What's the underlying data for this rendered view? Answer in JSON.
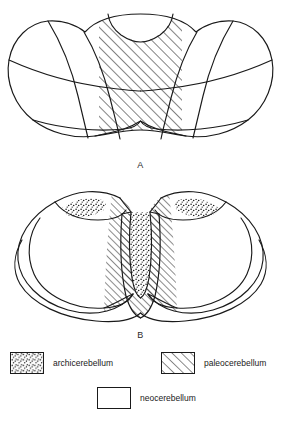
{
  "figure": {
    "panels": [
      {
        "id": "A",
        "label": "A",
        "view": "superior-view-cerebellum"
      },
      {
        "id": "B",
        "label": "B",
        "view": "inferior-view-cerebellum"
      }
    ]
  },
  "legend": {
    "items": [
      {
        "key": "archicerebellum",
        "label": "archicerebellum",
        "pattern": "stipple"
      },
      {
        "key": "paleocerebellum",
        "label": "paleocerebellum",
        "pattern": "diagonal-hatch"
      },
      {
        "key": "neocerebellum",
        "label": "neocerebellum",
        "pattern": "plain"
      }
    ]
  },
  "colors": {
    "ink": "#1a1a1a",
    "background": "#ffffff"
  }
}
